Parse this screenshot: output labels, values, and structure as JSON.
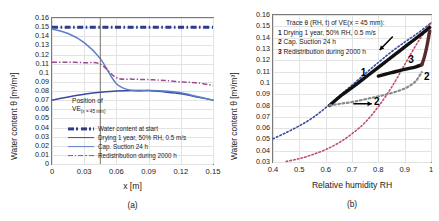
{
  "figure": {
    "panels": [
      {
        "id": "a",
        "caption": "(a)",
        "axes": {
          "ylabel": "Water content θ [m³/m³]",
          "xlabel": "x [m]",
          "xticks": [
            "0",
            "0.03",
            "0.06",
            "0.09",
            "0.12",
            "0.15"
          ],
          "xtick_values": [
            0,
            0.03,
            0.06,
            0.09,
            0.12,
            0.15
          ],
          "yticks": [
            "0",
            "0.01",
            "0.02",
            "0.03",
            "0.04",
            "0.05",
            "0.06",
            "0.07",
            "0.08",
            "0.09",
            "0.1",
            "0.11",
            "0.12",
            "0.13",
            "0.14",
            "0.15",
            "0.16"
          ],
          "ytick_values": [
            0,
            0.01,
            0.02,
            0.03,
            0.04,
            0.05,
            0.06,
            0.07,
            0.08,
            0.09,
            0.1,
            0.11,
            0.12,
            0.13,
            0.14,
            0.15,
            0.16
          ],
          "xlim": [
            0,
            0.15
          ],
          "ylim": [
            0,
            0.16
          ]
        },
        "annotation": {
          "line1": "Position of",
          "line2_main": "VE",
          "line2_sub": "(x = 45 mm)",
          "marker_x": 0.045
        },
        "legend": [
          {
            "label": "Water content at start",
            "color": "#2e3a8c",
            "style": "dashdot-thick"
          },
          {
            "label": "Drying 1 year, 50% RH, 0.5 m/s",
            "color": "#3a4a9e",
            "style": "solid"
          },
          {
            "label": "Cap. Suction 24 h",
            "color": "#5b7fc7",
            "style": "solid"
          },
          {
            "label": "Redistribution during 2000 h",
            "color": "#9b4a8f",
            "style": "dashdot"
          }
        ]
      },
      {
        "id": "b",
        "caption": "(b)",
        "axes": {
          "ylabel": "Water content θ [m³/m³]",
          "xlabel": "Relative humidity RH",
          "xticks": [
            "0.4",
            "0.5",
            "0.6",
            "0.7",
            "0.8",
            "0.9",
            "1"
          ],
          "xtick_values": [
            0.4,
            0.5,
            0.6,
            0.7,
            0.8,
            0.9,
            1.0
          ],
          "yticks": [
            "0.03",
            "0.04",
            "0.05",
            "0.06",
            "0.07",
            "0.08",
            "0.09",
            "0.1",
            "0.11",
            "0.12",
            "0.13",
            "0.14",
            "0.15",
            "0.16"
          ],
          "ytick_values": [
            0.03,
            0.04,
            0.05,
            0.06,
            0.07,
            0.08,
            0.09,
            0.1,
            0.11,
            0.12,
            0.13,
            0.14,
            0.15,
            0.16
          ],
          "xlim": [
            0.4,
            1.0
          ],
          "ylim": [
            0.03,
            0.16
          ]
        },
        "trace_box": {
          "title": "Trace θ (RH, t) of VE(x = 45 mm):",
          "items": [
            {
              "num": "1",
              "text": "Drying 1 year, 50% RH, 0.5 m/s"
            },
            {
              "num": "2",
              "text": "Cap. Suction 24 h"
            },
            {
              "num": "3",
              "text": "Redistribution during 2000 h"
            }
          ]
        },
        "curve_labels": [
          {
            "text": "1",
            "x": 0.745,
            "y": 0.109
          },
          {
            "text": "2",
            "x": 0.795,
            "y": 0.0835
          },
          {
            "text": "3",
            "x": 0.925,
            "y": 0.1205
          },
          {
            "text": "2",
            "x": 0.985,
            "y": 0.1055
          }
        ]
      }
    ]
  },
  "chart_data": [
    {
      "type": "line",
      "panel": "a",
      "title": "",
      "xlabel": "x [m]",
      "ylabel": "Water content θ [m³/m³]",
      "xlim": [
        0,
        0.15
      ],
      "ylim": [
        0,
        0.16
      ],
      "grid": true,
      "x": [
        0,
        0.015,
        0.03,
        0.045,
        0.06,
        0.075,
        0.09,
        0.105,
        0.12,
        0.135,
        0.15
      ],
      "series": [
        {
          "name": "Water content at start",
          "color": "#2e3a8c",
          "style": "dashdot-thick",
          "values": [
            0.15,
            0.15,
            0.15,
            0.15,
            0.15,
            0.15,
            0.15,
            0.15,
            0.15,
            0.15,
            0.15
          ]
        },
        {
          "name": "Drying 1 year, 50% RH, 0.5 m/s",
          "color": "#3a4a9e",
          "style": "solid",
          "values": [
            0.07,
            0.0735,
            0.0765,
            0.0785,
            0.08,
            0.0805,
            0.0805,
            0.079,
            0.077,
            0.0735,
            0.07
          ]
        },
        {
          "name": "Cap. Suction 24 h",
          "color": "#5b7fc7",
          "style": "solid",
          "values": [
            0.148,
            0.143,
            0.133,
            0.1155,
            0.088,
            0.0805,
            0.0805,
            0.08,
            0.078,
            0.074,
            0.07
          ]
        },
        {
          "name": "Redistribution during 2000 h",
          "color": "#9b4a8f",
          "style": "dashdot",
          "values": [
            0.1115,
            0.1115,
            0.111,
            0.1095,
            0.0945,
            0.093,
            0.0925,
            0.0915,
            0.09,
            0.089,
            0.086
          ]
        }
      ],
      "annotations": [
        {
          "type": "vline",
          "x": 0.045,
          "label": "Position of VE(x = 45 mm)"
        }
      ]
    },
    {
      "type": "line",
      "panel": "b",
      "title": "Trace θ (RH, t) of VE(x = 45 mm)",
      "xlabel": "Relative humidity RH",
      "ylabel": "Water content θ [m³/m³]",
      "xlim": [
        0.4,
        1.0
      ],
      "ylim": [
        0.03,
        0.16
      ],
      "grid": true,
      "series": [
        {
          "name": "Adsorption isotherm (boundary)",
          "color": "#3a4a9e",
          "style": "dotted",
          "x": [
            0.4,
            0.45,
            0.5,
            0.55,
            0.6,
            0.65,
            0.7,
            0.75,
            0.8,
            0.85,
            0.9,
            0.95,
            1.0
          ],
          "values": [
            0.0505,
            0.056,
            0.062,
            0.069,
            0.078,
            0.088,
            0.098,
            0.108,
            0.118,
            0.1275,
            0.136,
            0.144,
            0.153
          ]
        },
        {
          "name": "Desorption isotherm (boundary)",
          "color": "#c0506a",
          "style": "dotted",
          "x": [
            0.45,
            0.5,
            0.55,
            0.6,
            0.65,
            0.7,
            0.75,
            0.8,
            0.85,
            0.9,
            0.95,
            1.0
          ],
          "values": [
            0.0305,
            0.033,
            0.0365,
            0.041,
            0.047,
            0.055,
            0.065,
            0.079,
            0.096,
            0.116,
            0.136,
            0.153
          ]
        },
        {
          "name": "1 Drying 1 year, 50% RH, 0.5 m/s",
          "color": "#111111",
          "style": "solid-thick",
          "x": [
            0.615,
            0.66,
            0.71,
            0.76,
            0.81,
            0.86,
            0.91,
            0.96,
            0.995
          ],
          "values": [
            0.08,
            0.089,
            0.0975,
            0.1065,
            0.1155,
            0.1245,
            0.1335,
            0.1425,
            0.149
          ]
        },
        {
          "name": "2 Cap. Suction 24 h",
          "color": "#8a8a8a",
          "style": "dotted-thick",
          "x": [
            0.615,
            0.655,
            0.7,
            0.75,
            0.8,
            0.85,
            0.9,
            0.94,
            0.965
          ],
          "values": [
            0.08,
            0.0815,
            0.083,
            0.0855,
            0.088,
            0.091,
            0.095,
            0.101,
            0.1095
          ]
        },
        {
          "name": "3 Redistribution during 2000 h",
          "color": "#111111",
          "style": "solid-thick",
          "x": [
            0.8,
            0.85,
            0.9,
            0.94,
            0.965
          ],
          "values": [
            0.106,
            0.109,
            0.112,
            0.114,
            0.116
          ]
        },
        {
          "name": "2 return branch (suction to saturation)",
          "color": "#5a2a2a",
          "style": "solid-thick",
          "x": [
            0.965,
            0.975,
            0.985,
            0.995
          ],
          "values": [
            0.116,
            0.123,
            0.133,
            0.146
          ]
        }
      ],
      "arrows": [
        {
          "label": "1",
          "from": [
            0.855,
            0.141
          ],
          "to": [
            0.805,
            0.129
          ]
        },
        {
          "label": "2",
          "from": [
            0.705,
            0.0815
          ],
          "to": [
            0.775,
            0.0815
          ]
        }
      ]
    }
  ]
}
